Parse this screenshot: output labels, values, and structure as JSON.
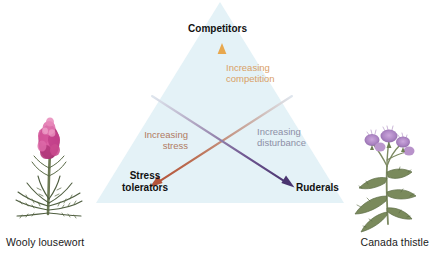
{
  "figure": {
    "type": "csr-triangle-diagram",
    "background": "#ffffff",
    "triangle": {
      "name": "grime-csr-triangle",
      "fill": "#e4f2f7",
      "apex": [
        220,
        2
      ],
      "bottom_left": [
        96,
        203
      ],
      "bottom_right": [
        344,
        203
      ]
    },
    "vertices": [
      {
        "id": "competitors",
        "label": "Competitors",
        "position": "top"
      },
      {
        "id": "stress-tolerators",
        "label": "Stress\ntolerators",
        "position": "bottom-left"
      },
      {
        "id": "ruderals",
        "label": "Ruderals",
        "position": "bottom-right"
      }
    ],
    "axes": [
      {
        "id": "competition",
        "label": "Increasing\ncompetition",
        "color": "#d9a066",
        "arrow_color": "#e8a84e",
        "direction": "up",
        "from": [
          222,
          194
        ],
        "to": [
          222,
          44
        ]
      },
      {
        "id": "stress",
        "label": "Increasing\nstress",
        "color": "#b07a62",
        "arrow_color": "#b4543a",
        "direction": "down-left",
        "from": [
          292,
          96
        ],
        "to": [
          152,
          186
        ]
      },
      {
        "id": "disturbance",
        "label": "Increasing\ndisturbance",
        "color": "#8d8fa6",
        "arrow_color": "#4a3570",
        "direction": "down-right",
        "from": [
          152,
          96
        ],
        "to": [
          292,
          186
        ]
      }
    ],
    "specimens": [
      {
        "id": "wooly-lousewort",
        "caption": "Wooly lousewort",
        "side": "left",
        "flower_color": "#c4468a",
        "foliage_color": "#5d6b4a"
      },
      {
        "id": "canada-thistle",
        "caption": "Canada thistle",
        "side": "right",
        "flower_color": "#b08ac4",
        "foliage_color": "#6d7f5a"
      }
    ]
  }
}
